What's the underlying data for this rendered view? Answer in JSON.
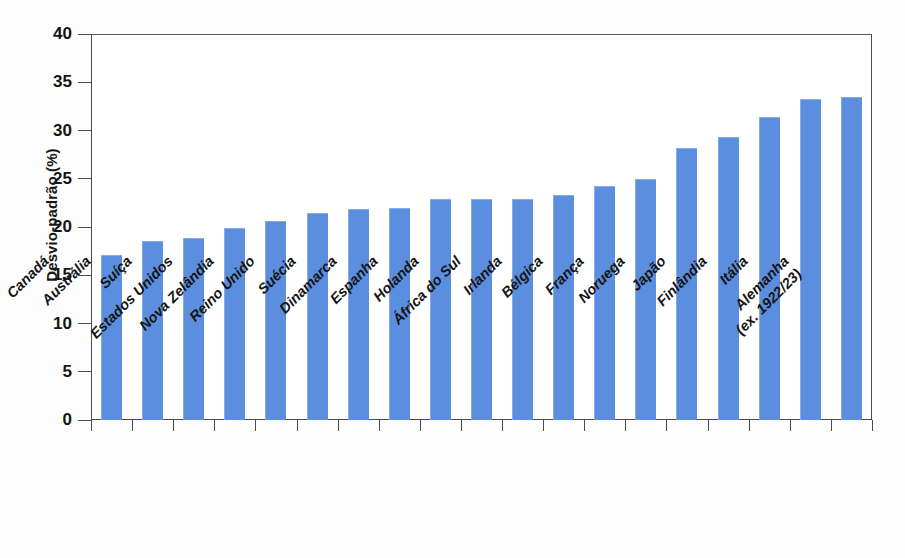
{
  "chart_data": {
    "type": "bar",
    "title": "",
    "xlabel": "",
    "ylabel": "Desvio-padrão (%)",
    "ylim": [
      0,
      40
    ],
    "yticks": [
      0,
      5,
      10,
      15,
      20,
      25,
      30,
      35,
      40
    ],
    "ytick_labels": [
      "0",
      "5",
      "10",
      "15",
      "20",
      "25",
      "30",
      "35",
      "40"
    ],
    "grid": false,
    "legend": "none",
    "bar_color": "#5b8ede",
    "axis_color": "#4b4b4b",
    "categories": [
      "Canadá",
      "Austrália",
      "Suíça",
      "Estados Unidos",
      "Nova Zelândia",
      "Reino Unido",
      "Suécia",
      "Dinamarca",
      "Espanha",
      "Holanda",
      "África do Sul",
      "Irlanda",
      "Bélgica",
      "França",
      "Noruega",
      "Japão",
      "Finlândia",
      "Itália",
      "Alemanha"
    ],
    "category_sublabels": [
      "",
      "",
      "",
      "",
      "",
      "",
      "",
      "",
      "",
      "",
      "",
      "",
      "",
      "",
      "",
      "",
      "",
      "",
      "(ex. 1922/23)"
    ],
    "values": [
      17.1,
      18.5,
      18.9,
      19.9,
      20.6,
      21.5,
      21.9,
      22.0,
      22.9,
      22.9,
      22.9,
      23.3,
      24.3,
      25.0,
      28.2,
      29.3,
      31.4,
      33.3,
      33.5
    ]
  }
}
